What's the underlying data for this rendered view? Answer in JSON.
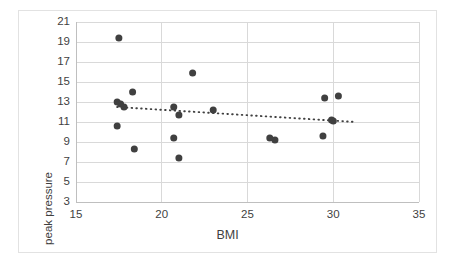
{
  "chart_data": {
    "type": "scatter",
    "title": "",
    "xlabel": "BMI",
    "ylabel": "peak pressure",
    "xlim": [
      15,
      35
    ],
    "ylim": [
      3,
      21
    ],
    "xticks": [
      15,
      20,
      25,
      30,
      35
    ],
    "yticks": [
      3,
      5,
      7,
      9,
      11,
      13,
      15,
      17,
      19,
      21
    ],
    "grid": "horizontal-and-vertical",
    "legend": "none",
    "marker_color": "#404040",
    "gridline_color": "#d9d9d9",
    "trendline": {
      "style": "dotted",
      "color": "#404040",
      "x0": 17.4,
      "y0": 12.5,
      "x1": 31.3,
      "y1": 11.0
    },
    "points": [
      {
        "x": 17.5,
        "y": 19.4
      },
      {
        "x": 21.8,
        "y": 15.9
      },
      {
        "x": 18.3,
        "y": 14.0
      },
      {
        "x": 29.5,
        "y": 13.4
      },
      {
        "x": 30.3,
        "y": 13.6
      },
      {
        "x": 17.4,
        "y": 13.0
      },
      {
        "x": 17.6,
        "y": 12.8
      },
      {
        "x": 17.8,
        "y": 12.5
      },
      {
        "x": 20.7,
        "y": 12.5
      },
      {
        "x": 21.0,
        "y": 11.7
      },
      {
        "x": 23.0,
        "y": 12.2
      },
      {
        "x": 29.9,
        "y": 11.2
      },
      {
        "x": 30.0,
        "y": 11.1
      },
      {
        "x": 17.4,
        "y": 10.6
      },
      {
        "x": 20.7,
        "y": 9.4
      },
      {
        "x": 26.3,
        "y": 9.4
      },
      {
        "x": 26.6,
        "y": 9.2
      },
      {
        "x": 29.4,
        "y": 9.6
      },
      {
        "x": 18.4,
        "y": 8.3
      },
      {
        "x": 21.0,
        "y": 7.4
      }
    ]
  }
}
